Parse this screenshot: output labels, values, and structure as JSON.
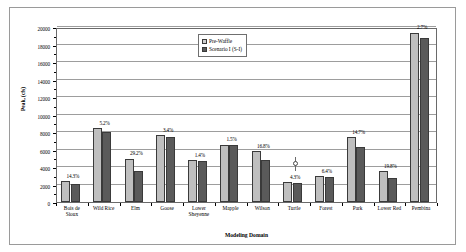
{
  "chart_data": {
    "type": "bar",
    "title": "",
    "xlabel": "Modeling Domain",
    "ylabel": "Peak, (cfs)",
    "ylim": [
      0,
      20000
    ],
    "ytick_labels": [
      "0",
      "2000",
      "4000",
      "6000",
      "8000",
      "10000",
      "12000",
      "14000",
      "16000",
      "18000",
      "20000"
    ],
    "ytick_values": [
      0,
      2000,
      4000,
      6000,
      8000,
      10000,
      12000,
      14000,
      16000,
      18000,
      20000
    ],
    "grid": true,
    "legend_position": "top-center",
    "categories": [
      "Bois de Sioux",
      "Wild Rice",
      "Elm",
      "Goose",
      "Lower Sheyenne",
      "Mapple",
      "Wilson",
      "Turtle",
      "Forest",
      "Park",
      "Lower Red",
      "Pembina"
    ],
    "category_lines": [
      [
        "Bois de",
        "Sioux"
      ],
      [
        "Wild Rice",
        ""
      ],
      [
        "Elm",
        ""
      ],
      [
        "Goose",
        ""
      ],
      [
        "Lower",
        "Sheyenne"
      ],
      [
        "Mapple",
        ""
      ],
      [
        "Wilson",
        ""
      ],
      [
        "Turtle",
        ""
      ],
      [
        "Forest",
        ""
      ],
      [
        "Park",
        ""
      ],
      [
        "Lower Red",
        ""
      ],
      [
        "Pembina",
        ""
      ]
    ],
    "series": [
      {
        "name": "Pre-Waffle",
        "color": "#bfbfbf",
        "values": [
          2400,
          8450,
          4950,
          7650,
          4750,
          6550,
          5800,
          2300,
          3000,
          7450,
          3500,
          19350
        ]
      },
      {
        "name": "Scenario I (S-I)",
        "color": "#5a5a5a",
        "values": [
          2060,
          8050,
          3500,
          7450,
          4700,
          6500,
          4820,
          2200,
          2830,
          6300,
          2800,
          18750
        ]
      }
    ],
    "annotations": [
      {
        "category": "Bois de Sioux",
        "text": "14.3%"
      },
      {
        "category": "Wild Rice",
        "text": "5.2%"
      },
      {
        "category": "Elm",
        "text": "29.2%"
      },
      {
        "category": "Goose",
        "text": "3.4%"
      },
      {
        "category": "Lower Sheyenne",
        "text": "1.4%"
      },
      {
        "category": "Mapple",
        "text": "1.5%"
      },
      {
        "category": "Wilson",
        "text": "16.8%"
      },
      {
        "category": "Turtle",
        "text": "4.3%"
      },
      {
        "category": "Forest",
        "text": "6.4%"
      },
      {
        "category": "Park",
        "text": "14.7%"
      },
      {
        "category": "Lower Red",
        "text": "19.8%"
      },
      {
        "category": "Pembina",
        "text": "2.7%"
      }
    ],
    "marker_annotation": {
      "category": "Turtle",
      "symbol": "circle-on-stem"
    }
  },
  "legend": {
    "items": [
      {
        "label": "Pre-Waffle"
      },
      {
        "label": "Scenario I (S-I)"
      }
    ]
  },
  "axes": {
    "y_title": "Peak, (cfs)",
    "x_title": "Modeling Domain"
  }
}
